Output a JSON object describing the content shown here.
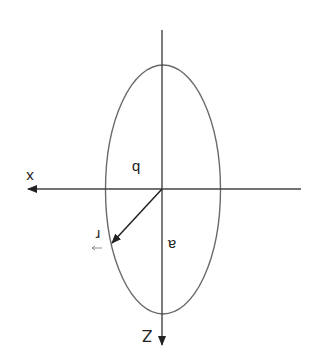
{
  "diagram": {
    "colors": {
      "stroke": "#555555",
      "axis": "#333333",
      "background": "#ffffff"
    },
    "axes": {
      "horizontal_label": "x",
      "vertical_label": "Z"
    },
    "labels": {
      "semi_minor": "b",
      "semi_major": "a",
      "position_vector": "r"
    }
  }
}
